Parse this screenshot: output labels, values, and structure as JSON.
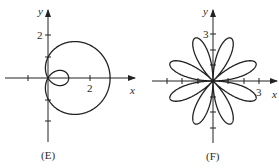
{
  "panels": [
    {
      "id": "E",
      "caption": "(E)",
      "x_axis_label": "x",
      "y_axis_label": "y",
      "x_tick_label": "2",
      "y_tick_label": "2",
      "curve": "limacon with inner loop, r = 1 + 2cos(theta)"
    },
    {
      "id": "F",
      "caption": "(F)",
      "x_axis_label": "x",
      "y_axis_label": "y",
      "x_tick_label": "3",
      "y_tick_label": "3",
      "curve": "eight-petal rose, r = 3 sin(4 theta)"
    }
  ],
  "colors": {
    "stroke": "#222222",
    "background": "#ffffff"
  }
}
